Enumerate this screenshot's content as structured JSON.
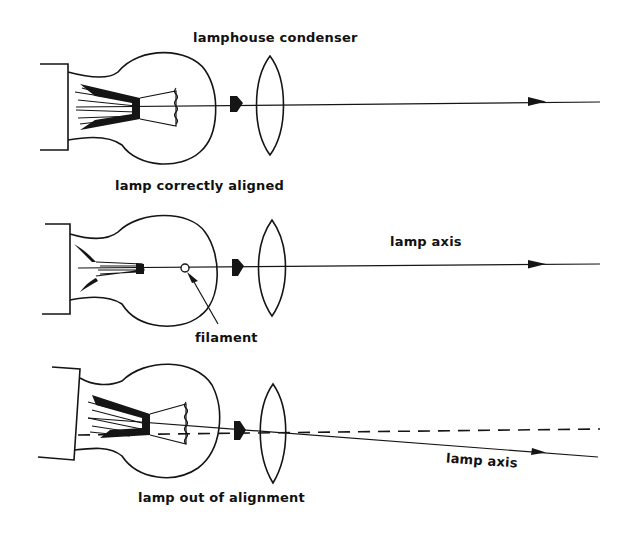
{
  "diagram": {
    "type": "optics-illustration",
    "ink_color": "#151515",
    "background": "#ffffff",
    "panels": [
      {
        "id": "aligned",
        "title_label": "lamphouse condenser",
        "caption": "lamp correctly aligned",
        "axis_label": "",
        "filament_label": ""
      },
      {
        "id": "side-view",
        "title_label": "",
        "caption": "",
        "axis_label": "lamp axis",
        "filament_label": "filament"
      },
      {
        "id": "misaligned",
        "title_label": "",
        "caption": "lamp out of alignment",
        "axis_label": "lamp axis",
        "filament_label": ""
      }
    ]
  }
}
